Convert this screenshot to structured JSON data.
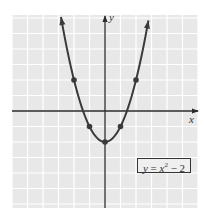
{
  "chart_data": {
    "type": "line",
    "title": "",
    "equation_label": "y = x² − 2",
    "xlabel": "x",
    "ylabel": "y",
    "xlim": [
      -6,
      6
    ],
    "ylim": [
      -6.3,
      6.2
    ],
    "grid": true,
    "grid_step": 1,
    "series": [
      {
        "name": "y = x^2 - 2",
        "function": "x^2 - 2",
        "x_range": [
          -2.84,
          2.8
        ],
        "arrows_both_ends": true,
        "marked_points": [
          {
            "x": -2,
            "y": 2
          },
          {
            "x": -1,
            "y": -1
          },
          {
            "x": 0,
            "y": -2
          },
          {
            "x": 1,
            "y": -1
          },
          {
            "x": 2,
            "y": 2
          }
        ]
      }
    ],
    "colors": {
      "grid_background": "#e8e8e8",
      "grid_lines": "#ffffff",
      "curve": "#3a3a3a",
      "axes": "#2a2a2a"
    }
  },
  "labels": {
    "x_axis": "x",
    "y_axis": "y",
    "equation_y": "y",
    "equation_eq": " = ",
    "equation_x": "x",
    "equation_sup": "2",
    "equation_rest": " − 2"
  }
}
